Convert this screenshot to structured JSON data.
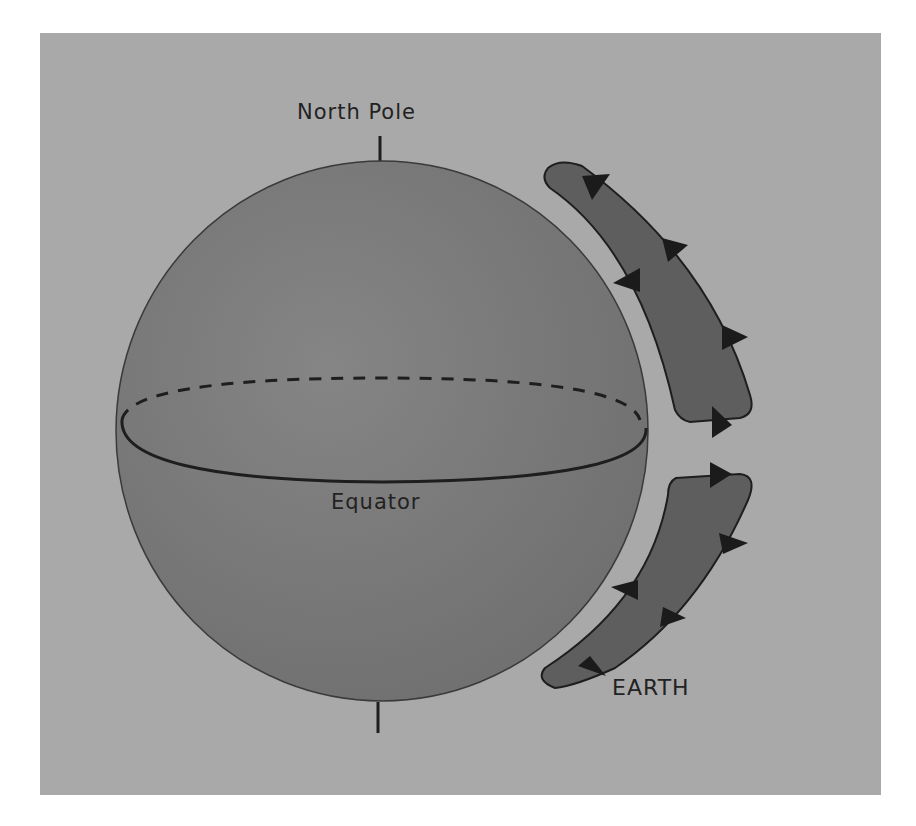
{
  "diagram": {
    "labels": {
      "north_pole": "North Pole",
      "equator": "Equator",
      "earth": "EARTH"
    },
    "colors": {
      "page_background": "#ffffff",
      "panel": "#a9a9a9",
      "sphere": "#7b7b7b",
      "sphere_outline": "#3a3a3a",
      "earth_band": "#5e5e5e",
      "arrow": "#1b1b1b",
      "line": "#1e1e1e"
    },
    "elements": [
      {
        "type": "sphere",
        "description": "large sphere with north pole axis tick and equator ellipse"
      },
      {
        "type": "equator",
        "front": "solid",
        "back": "dashed"
      },
      {
        "type": "earth-arc-north",
        "arrows": 5
      },
      {
        "type": "earth-arc-south",
        "arrows": 5
      }
    ]
  }
}
